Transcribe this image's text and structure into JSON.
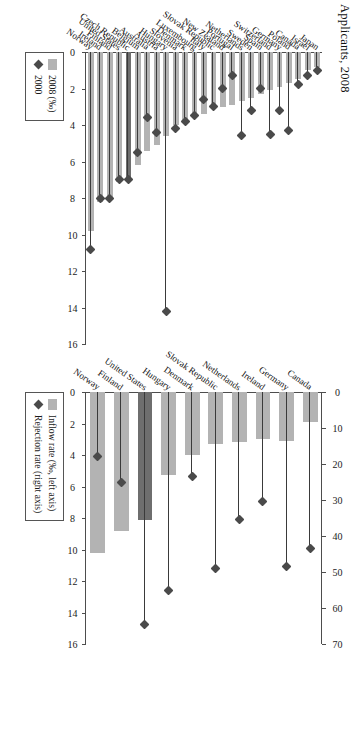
{
  "title": "Applicants, 2008",
  "charts": [
    {
      "id": "asylum-inflow-rejection",
      "legend": {
        "bar_label": "Inflow rate (‰, left axis)",
        "diamond_label": "Rejection rate (right axis)",
        "bar_icon": "bar-swatch-icon",
        "diamond_icon": "diamond-marker-icon"
      },
      "left_axis": {
        "label": "",
        "min": 0,
        "max": 16,
        "ticks": [
          0,
          2,
          4,
          6,
          8,
          10,
          12,
          14,
          16
        ]
      },
      "right_axis": {
        "label": "",
        "min": 0,
        "max": 70,
        "ticks": [
          0,
          10,
          20,
          30,
          40,
          50,
          60,
          70
        ]
      },
      "categories": [
        "Norway",
        "Finland",
        "United States",
        "Hungary",
        "Denmark",
        "Slovak Republic",
        "Netherlands",
        "Ireland",
        "Germany",
        "Canada"
      ],
      "bars": [
        10.2,
        8.8,
        8.1,
        5.3,
        4.0,
        3.3,
        3.2,
        3.0,
        3.1,
        1.9
      ],
      "diamonds": [
        18.0,
        25.0,
        64.5,
        55.0,
        23.5,
        49.0,
        35.5,
        30.5,
        48.5,
        43.5
      ],
      "highlight_index": 2
    },
    {
      "id": "asylum-applicants-2008-2000",
      "legend": {
        "bar_label": "2008 (‰)",
        "diamond_label": "2000",
        "bar_icon": "bar-swatch-icon",
        "diamond_icon": "diamond-marker-icon"
      },
      "left_axis": {
        "label": "",
        "min": 0,
        "max": 16,
        "ticks": [
          0,
          2,
          4,
          6,
          8,
          10,
          12,
          14,
          16
        ]
      },
      "categories": [
        "Norway",
        "Ireland",
        "Finland",
        "United States",
        "Czech Republic",
        "Belgium",
        "Australia",
        "Austria",
        "Hungary",
        "Slovenia",
        "Denmark",
        "Luxembourg",
        "Italy",
        "Slovak Republic",
        "New Zealand",
        "Portugal",
        "Netherlands",
        "Sweden",
        "Spain",
        "Switzerland",
        "Germany",
        "Poland",
        "Canada",
        "Israel",
        "Japan"
      ],
      "bars": [
        9.8,
        8.2,
        8.0,
        7.1,
        7.0,
        6.2,
        5.4,
        5.1,
        4.6,
        4.0,
        3.9,
        3.6,
        3.4,
        3.1,
        3.0,
        2.9,
        2.7,
        2.5,
        2.3,
        2.1,
        1.9,
        1.7,
        1.5,
        1.0,
        0.8
      ],
      "diamonds": [
        10.8,
        8.0,
        8.0,
        7.0,
        7.0,
        5.5,
        3.6,
        4.4,
        14.2,
        4.2,
        3.8,
        3.5,
        2.6,
        3.0,
        2.0,
        1.3,
        4.6,
        3.2,
        2.0,
        4.5,
        3.2,
        4.3,
        1.8,
        1.3,
        1.0
      ],
      "highlight_index": 4
    }
  ]
}
